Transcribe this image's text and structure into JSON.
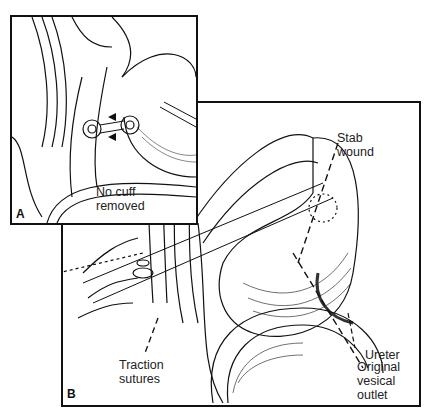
{
  "figure": {
    "panels": [
      {
        "id": "A",
        "letter": "A",
        "labels": {
          "cuff": "No cuff\nremoved"
        }
      },
      {
        "id": "B",
        "letter": "B",
        "labels": {
          "stab_wound": "Stab\nwound",
          "ureter": "Ureter",
          "traction_sutures": "Traction\nsutures",
          "original_vesical_outlet": "Original\nvesical\noutlet"
        }
      }
    ]
  }
}
